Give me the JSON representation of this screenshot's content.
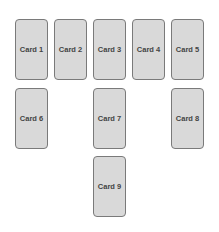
{
  "header": {
    "clipped_text": "— — — — — — — — — — — — — — — — — —"
  },
  "cards": [
    {
      "label": "Card 1",
      "left": 15,
      "top": 19
    },
    {
      "label": "Card 2",
      "left": 54,
      "top": 19
    },
    {
      "label": "Card 3",
      "left": 93,
      "top": 19
    },
    {
      "label": "Card 4",
      "left": 132,
      "top": 19
    },
    {
      "label": "Card 5",
      "left": 171,
      "top": 19
    },
    {
      "label": "Card 6",
      "left": 15,
      "top": 88
    },
    {
      "label": "Card 7",
      "left": 93,
      "top": 88
    },
    {
      "label": "Card 8",
      "left": 171,
      "top": 88
    },
    {
      "label": "Card 9",
      "left": 93,
      "top": 156
    }
  ],
  "colors": {
    "card_fill": "#d9d9d9",
    "card_border": "#7a7a7a",
    "text": "#444444"
  }
}
